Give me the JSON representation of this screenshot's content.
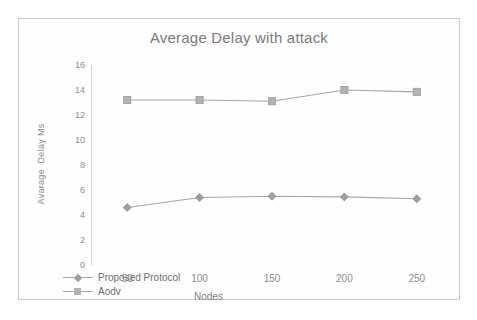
{
  "chart_data": {
    "type": "line",
    "title": "Average Delay with attack",
    "xlabel": "Nodes",
    "ylabel": "Avarage  Delay Ms",
    "categories": [
      "50",
      "100",
      "150",
      "200",
      "250"
    ],
    "ylim": [
      0,
      16
    ],
    "yticks": [
      "16",
      "14",
      "12",
      "10",
      "8",
      "6",
      "4",
      "2",
      "0"
    ],
    "ytick_values": [
      16,
      14,
      12,
      10,
      8,
      6,
      4,
      2,
      0
    ],
    "grid": false,
    "legend_position": "bottom-left",
    "series": [
      {
        "name": "Proposed Protocol",
        "marker": "diamond",
        "color": "#9e9e9e",
        "values": [
          4.6,
          5.4,
          5.5,
          5.45,
          5.3
        ]
      },
      {
        "name": "Aodv",
        "marker": "square",
        "color": "#b3b3b3",
        "values": [
          13.2,
          13.2,
          13.1,
          14.0,
          13.85
        ]
      }
    ]
  },
  "legend": [
    {
      "label": "Proposed Protocol",
      "marker": "diamond"
    },
    {
      "label": "Aodv",
      "marker": "square"
    }
  ]
}
